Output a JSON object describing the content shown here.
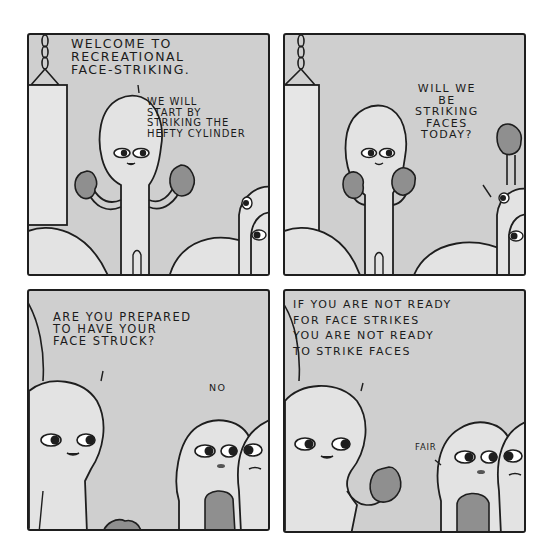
{
  "comic": {
    "style": "grayscale four-panel comic",
    "colors": {
      "background": "#ffffff",
      "panel_fill": "#cfcfcf",
      "outline": "#1e1e1e",
      "character_fill": "#e3e3e3",
      "glove_fill": "#8f8f8f",
      "bag_fill": "#e6e6e6"
    },
    "panels": [
      {
        "id": 1,
        "description": "Instructor with raised boxing gloves beside a hanging punching bag; two onlookers peek from the right",
        "speech": [
          {
            "speaker": "instructor",
            "text": "WELCOME TO\nRECREATIONAL\nFACE-STRIKING."
          },
          {
            "speaker": "instructor",
            "text": "WE WILL\nSTART BY\nSTRIKING THE\nHEFTY CYLINDER"
          }
        ]
      },
      {
        "id": 2,
        "description": "Instructor in boxing stance; an onlooker at right raises a glove to ask a question",
        "speech": [
          {
            "speaker": "onlooker",
            "text": "WILL WE\nBE\nSTRIKING\nFACES\nTODAY?"
          }
        ]
      },
      {
        "id": 3,
        "description": "Close-up of instructor facing two students wearing gloves",
        "speech": [
          {
            "speaker": "instructor",
            "text": "ARE YOU PREPARED\nTO HAVE YOUR\nFACE STRUCK?"
          },
          {
            "speaker": "student",
            "text": "NO"
          }
        ]
      },
      {
        "id": 4,
        "description": "Instructor raising a glove; students respond",
        "speech": [
          {
            "speaker": "instructor",
            "text": "IF YOU ARE NOT READY\nFOR FACE STRIKES\nYOU ARE NOT READY\nTO STRIKE FACES"
          },
          {
            "speaker": "student",
            "text": "FAIR"
          }
        ]
      }
    ]
  }
}
